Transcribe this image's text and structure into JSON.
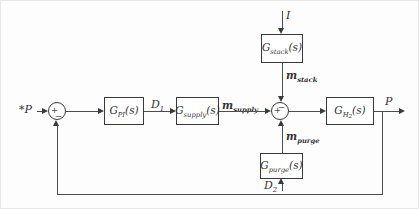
{
  "diagram": {
    "type": "control-loop-block-diagram",
    "blocks": {
      "controller": {
        "base": "G",
        "sub": "PI",
        "arg": "(s)"
      },
      "supply": {
        "base": "G",
        "sub": "supply",
        "arg": "(s)"
      },
      "stack": {
        "base": "G",
        "sub": "stack",
        "arg": "(s)"
      },
      "purge": {
        "base": "G",
        "sub": "purge",
        "arg": "(s)"
      },
      "h2": {
        "base": "G",
        "sub": "H",
        "subsub": "2",
        "arg": "(s)"
      }
    },
    "signals": {
      "reference": {
        "main": "*P"
      },
      "current": {
        "main": "I"
      },
      "d1": {
        "main": "D",
        "sub": "1"
      },
      "d2": {
        "main": "D",
        "sub": "2"
      },
      "m_supply": {
        "main": "m",
        "sub": "supply"
      },
      "m_stack": {
        "main": "m",
        "sub": "stack"
      },
      "m_purge": {
        "main": "m",
        "sub": "purge"
      },
      "output": {
        "main": "P"
      }
    },
    "sum_junctions": {
      "sum1": {
        "left_sign": "+",
        "bottom_sign": "−"
      },
      "sum2": {
        "left_sign": "+",
        "top_sign": "−"
      }
    },
    "colors": {
      "line": "#4d4d4d",
      "block_border": "#3a3a3a",
      "text": "#333333",
      "background": "#fdfdfd"
    }
  }
}
